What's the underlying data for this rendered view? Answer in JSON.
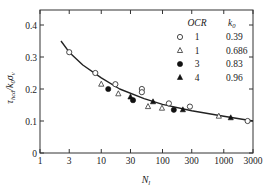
{
  "chart_data": {
    "type": "scatter",
    "title": "",
    "xlabel": "N_l",
    "ylabel": "τ_hcd / k0 σ'v",
    "xscale": "log",
    "xlim": [
      1,
      3000
    ],
    "ylim": [
      0,
      0.45
    ],
    "x_ticks": [
      "1",
      "3",
      "10",
      "30",
      "100",
      "300",
      "1000",
      "3000"
    ],
    "x_tick_values": [
      1,
      3,
      10,
      30,
      100,
      300,
      1000,
      3000
    ],
    "y_ticks": [
      "0",
      "0.1",
      "0.2",
      "0.3",
      "0.4"
    ],
    "y_tick_values": [
      0,
      0.1,
      0.2,
      0.3,
      0.4
    ],
    "grid": false,
    "legend_position": "upper right",
    "legend_header": {
      "ocr": "OCR",
      "k0": "k0"
    },
    "series": [
      {
        "name": "OCR 1, k0 0.39",
        "ocr": "1",
        "k0": "0.39",
        "marker": "open-circle",
        "points": [
          [
            3,
            0.315
          ],
          [
            8,
            0.25
          ],
          [
            17,
            0.215
          ],
          [
            46,
            0.2
          ],
          [
            46,
            0.19
          ],
          [
            127,
            0.155
          ],
          [
            280,
            0.145
          ],
          [
            2450,
            0.1
          ]
        ]
      },
      {
        "name": "OCR 1, k0 0.686",
        "ocr": "1",
        "k0": "0.686",
        "marker": "open-triangle",
        "points": [
          [
            10,
            0.215
          ],
          [
            19,
            0.185
          ],
          [
            58,
            0.145
          ],
          [
            98,
            0.14
          ],
          [
            830,
            0.115
          ]
        ]
      },
      {
        "name": "OCR 3, k0 0.83",
        "ocr": "3",
        "k0": "0.83",
        "marker": "filled-circle",
        "points": [
          [
            13,
            0.2
          ],
          [
            33,
            0.165
          ],
          [
            153,
            0.135
          ]
        ]
      },
      {
        "name": "OCR 4, k0 0.96",
        "ocr": "4",
        "k0": "0.96",
        "marker": "filled-triangle",
        "points": [
          [
            30,
            0.175
          ],
          [
            70,
            0.16
          ],
          [
            215,
            0.135
          ],
          [
            1300,
            0.11
          ]
        ]
      }
    ],
    "fit_curve": {
      "name": "fitted trend",
      "points": [
        [
          2.2,
          0.35
        ],
        [
          3,
          0.315
        ],
        [
          5,
          0.275
        ],
        [
          10,
          0.235
        ],
        [
          20,
          0.2
        ],
        [
          50,
          0.17
        ],
        [
          100,
          0.152
        ],
        [
          300,
          0.132
        ],
        [
          1000,
          0.115
        ],
        [
          3000,
          0.1
        ]
      ]
    }
  }
}
